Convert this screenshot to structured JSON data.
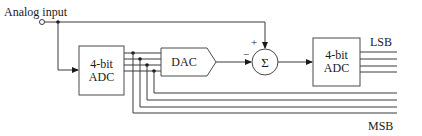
{
  "diagram": {
    "input_label": "Analog input",
    "adc1": {
      "line1": "4-bit",
      "line2": "ADC"
    },
    "dac": {
      "label": "DAC"
    },
    "summer": {
      "symbol": "Σ",
      "plus": "+",
      "minus": "−"
    },
    "adc2": {
      "line1": "4-bit",
      "line2": "ADC"
    },
    "lsb_label": "LSB",
    "msb_label": "MSB",
    "colors": {
      "line": "#3a3a3a",
      "text": "#1a1a1a",
      "background": "#ffffff"
    }
  }
}
